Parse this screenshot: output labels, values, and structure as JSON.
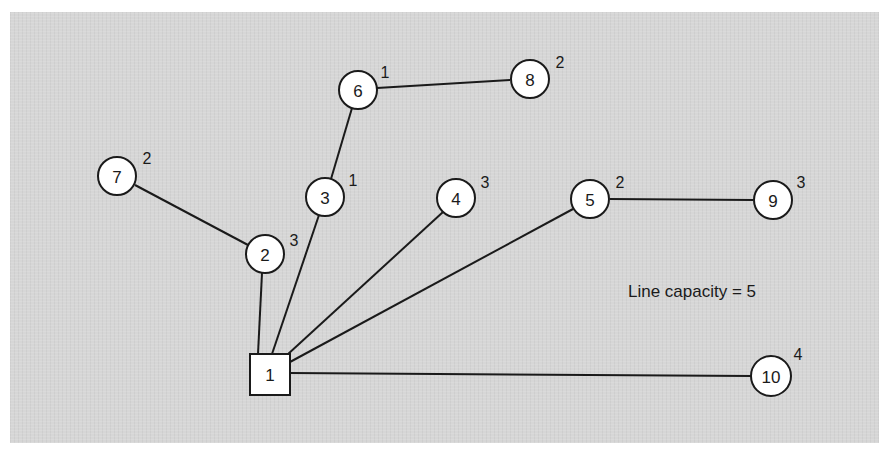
{
  "diagram": {
    "annotation": "Line capacity = 5",
    "root": {
      "id": "1",
      "label": "1",
      "shape": "square",
      "x": 270,
      "y": 374,
      "size": 40
    },
    "nodes": [
      {
        "id": "2",
        "label": "2",
        "weight": "3",
        "x": 265,
        "y": 254
      },
      {
        "id": "3",
        "label": "3",
        "weight": "1",
        "x": 325,
        "y": 197
      },
      {
        "id": "4",
        "label": "4",
        "weight": "3",
        "x": 456,
        "y": 198
      },
      {
        "id": "5",
        "label": "5",
        "weight": "2",
        "x": 590,
        "y": 199
      },
      {
        "id": "6",
        "label": "6",
        "weight": "1",
        "x": 358,
        "y": 90
      },
      {
        "id": "7",
        "label": "7",
        "weight": "2",
        "x": 117,
        "y": 176
      },
      {
        "id": "8",
        "label": "8",
        "weight": "2",
        "x": 530,
        "y": 79
      },
      {
        "id": "9",
        "label": "9",
        "weight": "3",
        "x": 773,
        "y": 200
      },
      {
        "id": "10",
        "label": "10",
        "weight": "4",
        "x": 771,
        "y": 376
      }
    ],
    "edges": [
      [
        "1",
        "2"
      ],
      [
        "1",
        "3"
      ],
      [
        "1",
        "4"
      ],
      [
        "1",
        "5"
      ],
      [
        "1",
        "10"
      ],
      [
        "2",
        "7"
      ],
      [
        "3",
        "6"
      ],
      [
        "6",
        "8"
      ],
      [
        "5",
        "9"
      ]
    ],
    "colors": {
      "panel": "#d6d6d6",
      "stroke": "#1a1a1a",
      "node_fill": "#ffffff"
    }
  }
}
